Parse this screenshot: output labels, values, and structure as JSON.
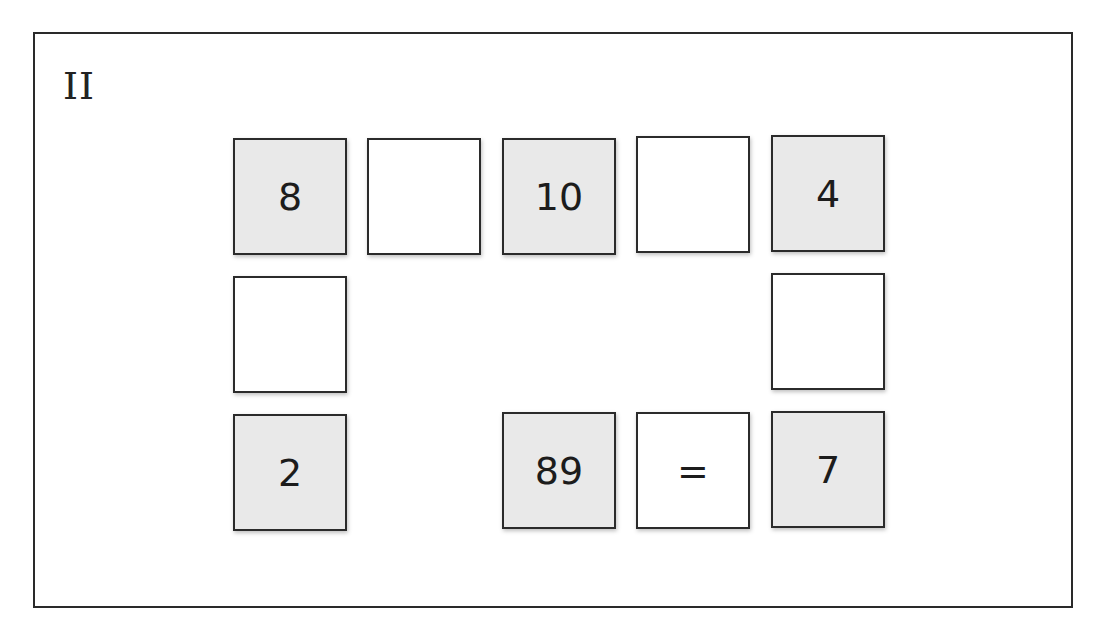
{
  "puzzle": {
    "label": "II",
    "colors": {
      "filled_cell": "#e9e9e9",
      "empty_cell": "#ffffff",
      "border": "#2b2b2b",
      "text": "#1c1c1c"
    },
    "cells": [
      {
        "row": 0,
        "col": 0,
        "value": "8",
        "type": "number"
      },
      {
        "row": 0,
        "col": 1,
        "value": "",
        "type": "blank"
      },
      {
        "row": 0,
        "col": 2,
        "value": "10",
        "type": "number"
      },
      {
        "row": 0,
        "col": 3,
        "value": "",
        "type": "blank"
      },
      {
        "row": 0,
        "col": 4,
        "value": "4",
        "type": "number"
      },
      {
        "row": 1,
        "col": 0,
        "value": "",
        "type": "blank"
      },
      {
        "row": 1,
        "col": 4,
        "value": "",
        "type": "blank"
      },
      {
        "row": 2,
        "col": 0,
        "value": "2",
        "type": "number"
      },
      {
        "row": 2,
        "col": 2,
        "value": "89",
        "type": "number"
      },
      {
        "row": 2,
        "col": 3,
        "value": "=",
        "type": "operator"
      },
      {
        "row": 2,
        "col": 4,
        "value": "7",
        "type": "number"
      }
    ]
  }
}
